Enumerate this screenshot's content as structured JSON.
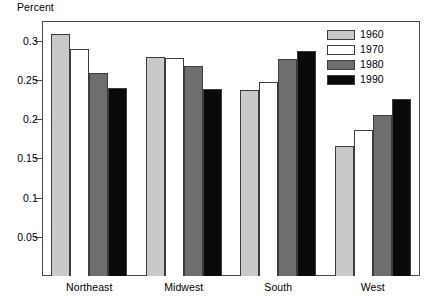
{
  "chart_data": {
    "type": "bar",
    "title": "",
    "xlabel": "",
    "ylabel": "Percent",
    "categories": [
      "Northeast",
      "Midwest",
      "South",
      "West"
    ],
    "series": [
      {
        "name": "1960",
        "color": "#c9c9c9",
        "values": [
          0.309,
          0.279,
          0.237,
          0.166
        ]
      },
      {
        "name": "1970",
        "color": "#ffffff",
        "values": [
          0.289,
          0.278,
          0.247,
          0.186
        ]
      },
      {
        "name": "1980",
        "color": "#6e6e6e",
        "values": [
          0.259,
          0.268,
          0.277,
          0.205
        ]
      },
      {
        "name": "1990",
        "color": "#0a0a0a",
        "values": [
          0.239,
          0.238,
          0.287,
          0.226
        ]
      }
    ],
    "ylim": [
      0,
      0.325
    ],
    "yticks": [
      0.05,
      0.1,
      0.15,
      0.2,
      0.25,
      0.3
    ],
    "ytick_labels": [
      "0.05",
      "0.1",
      "0.15",
      "0.2",
      "0.25",
      "0.3"
    ],
    "grid": false,
    "legend_position": "top-right",
    "legend_entries": [
      "1960",
      "1970",
      "1980",
      "1990"
    ]
  },
  "axis": {
    "y_title": "Percent"
  }
}
